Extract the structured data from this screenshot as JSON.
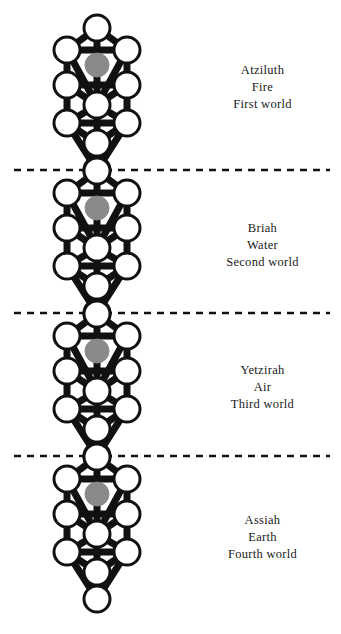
{
  "figure": {
    "background_color": "#ffffff",
    "node_fill": "#ffffff",
    "node_stroke": "#111111",
    "path_color": "#111111",
    "daath_fill": "#8a8a8a",
    "divider_color": "#111111",
    "text_color": "#1a1a1a"
  },
  "geometry": {
    "canvas_width": 341,
    "canvas_height": 634,
    "tree_center_x": 97,
    "node_radius": 13,
    "daath_radius": 12,
    "path_width": 7,
    "node_stroke_width": 3,
    "world_period": 143,
    "first_kether_y": 28,
    "row_offsets": [
      0,
      22,
      37,
      57,
      77,
      95,
      115,
      142
    ],
    "column_offsets": [
      -30,
      0,
      30
    ],
    "sephirah_layout": [
      {
        "key": "kether",
        "col": 0,
        "row_y": 0,
        "daath": false
      },
      {
        "key": "binah",
        "col": -30,
        "row_y": 22,
        "daath": false
      },
      {
        "key": "chokmah",
        "col": 30,
        "row_y": 22,
        "daath": false
      },
      {
        "key": "daath",
        "col": 0,
        "row_y": 37,
        "daath": true
      },
      {
        "key": "geburah",
        "col": -30,
        "row_y": 57,
        "daath": false
      },
      {
        "key": "chesed",
        "col": 30,
        "row_y": 57,
        "daath": false
      },
      {
        "key": "tiphareth",
        "col": 0,
        "row_y": 77,
        "daath": false
      },
      {
        "key": "hod",
        "col": -30,
        "row_y": 95,
        "daath": false
      },
      {
        "key": "netzach",
        "col": 30,
        "row_y": 95,
        "daath": false
      },
      {
        "key": "yesod",
        "col": 0,
        "row_y": 115,
        "daath": false
      },
      {
        "key": "malkuth",
        "col": 0,
        "row_y": 142,
        "daath": false
      }
    ],
    "paths": [
      [
        "kether",
        "binah"
      ],
      [
        "kether",
        "chokmah"
      ],
      [
        "kether",
        "tiphareth"
      ],
      [
        "binah",
        "chokmah"
      ],
      [
        "binah",
        "geburah"
      ],
      [
        "binah",
        "tiphareth"
      ],
      [
        "chokmah",
        "chesed"
      ],
      [
        "chokmah",
        "tiphareth"
      ],
      [
        "geburah",
        "chesed"
      ],
      [
        "geburah",
        "tiphareth"
      ],
      [
        "geburah",
        "hod"
      ],
      [
        "chesed",
        "tiphareth"
      ],
      [
        "chesed",
        "netzach"
      ],
      [
        "tiphareth",
        "hod"
      ],
      [
        "tiphareth",
        "netzach"
      ],
      [
        "tiphareth",
        "yesod"
      ],
      [
        "hod",
        "netzach"
      ],
      [
        "hod",
        "yesod"
      ],
      [
        "hod",
        "malkuth"
      ],
      [
        "netzach",
        "yesod"
      ],
      [
        "netzach",
        "malkuth"
      ],
      [
        "yesod",
        "malkuth"
      ]
    ],
    "dividers_y": [
      170,
      313,
      456
    ],
    "divider_dash": "7 6",
    "divider_x_start": 14,
    "divider_x_end": 330
  },
  "worlds": [
    {
      "index": 1,
      "name": "Atziluth",
      "element": "Fire",
      "ordinal": "First world",
      "label_x": 190,
      "label_y": 62,
      "tree_top_y": 28
    },
    {
      "index": 2,
      "name": "Briah",
      "element": "Water",
      "ordinal": "Second world",
      "label_x": 190,
      "label_y": 220,
      "tree_top_y": 171
    },
    {
      "index": 3,
      "name": "Yetzirah",
      "element": "Air",
      "ordinal": "Third world",
      "label_x": 190,
      "label_y": 362,
      "tree_top_y": 314
    },
    {
      "index": 4,
      "name": "Assiah",
      "element": "Earth",
      "ordinal": "Fourth world",
      "label_x": 190,
      "label_y": 512,
      "tree_top_y": 457
    }
  ]
}
